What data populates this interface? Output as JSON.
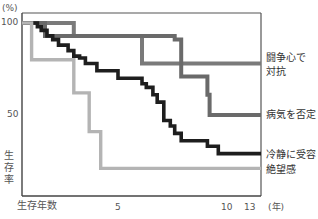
{
  "chart_data": {
    "type": "line",
    "subtype": "step (Kaplan-Meier survival curve)",
    "title": "",
    "xlabel": "生存年数",
    "x_unit": "(年)",
    "ylabel": "生存率",
    "y_unit": "(%)",
    "x_ticks": [
      {
        "label": "5",
        "value": 5
      },
      {
        "label": "10",
        "value": 10
      },
      {
        "label": "13",
        "value": 13
      }
    ],
    "y_ticks": [
      {
        "label": "100",
        "value": 100
      },
      {
        "label": "50",
        "value": 50
      }
    ],
    "xlim": [
      0,
      13
    ],
    "ylim": [
      15,
      100
    ],
    "grid": false,
    "legend_position": "right, labels placed at line ends",
    "series": [
      {
        "name": "闘争心で対抗",
        "label_lines": [
          "闘争心で",
          "対抗"
        ],
        "color": "#7a7a7a",
        "points": [
          [
            0,
            100
          ],
          [
            2.7,
            100
          ],
          [
            2.7,
            93
          ],
          [
            6.1,
            93
          ],
          [
            6.1,
            78
          ],
          [
            13,
            78
          ]
        ]
      },
      {
        "name": "病気を否定",
        "label_lines": [
          "病気を否定"
        ],
        "color": "#6a6a6a",
        "points": [
          [
            0,
            100
          ],
          [
            1.2,
            100
          ],
          [
            1.2,
            93
          ],
          [
            7.6,
            93
          ],
          [
            7.6,
            91
          ],
          [
            7.9,
            91
          ],
          [
            7.9,
            71
          ],
          [
            9.1,
            71
          ],
          [
            9.1,
            61
          ],
          [
            9.2,
            61
          ],
          [
            9.2,
            50
          ],
          [
            13,
            50
          ]
        ]
      },
      {
        "name": "冷静に受容",
        "label_lines": [
          "冷静に受容"
        ],
        "color": "#1e1e1e",
        "points": [
          [
            0,
            100
          ],
          [
            0.8,
            100
          ],
          [
            0.8,
            98
          ],
          [
            1.0,
            98
          ],
          [
            1.0,
            96
          ],
          [
            1.3,
            96
          ],
          [
            1.3,
            93
          ],
          [
            1.6,
            93
          ],
          [
            1.6,
            91
          ],
          [
            1.9,
            91
          ],
          [
            1.9,
            88
          ],
          [
            2.4,
            88
          ],
          [
            2.4,
            85
          ],
          [
            2.7,
            85
          ],
          [
            2.7,
            82
          ],
          [
            3.0,
            82
          ],
          [
            3.0,
            81
          ],
          [
            3.3,
            81
          ],
          [
            3.3,
            78
          ],
          [
            3.9,
            78
          ],
          [
            3.9,
            74
          ],
          [
            5.0,
            74
          ],
          [
            5.0,
            70
          ],
          [
            6.1,
            70
          ],
          [
            6.1,
            67
          ],
          [
            6.3,
            67
          ],
          [
            6.3,
            65
          ],
          [
            6.6,
            65
          ],
          [
            6.6,
            61
          ],
          [
            6.8,
            61
          ],
          [
            6.8,
            57
          ],
          [
            7.1,
            57
          ],
          [
            7.1,
            47
          ],
          [
            7.4,
            47
          ],
          [
            7.4,
            44
          ],
          [
            7.6,
            44
          ],
          [
            7.6,
            40
          ],
          [
            7.9,
            40
          ],
          [
            7.9,
            36
          ],
          [
            9.1,
            36
          ],
          [
            9.1,
            33
          ],
          [
            9.6,
            33
          ],
          [
            9.6,
            29
          ],
          [
            13,
            29
          ]
        ]
      },
      {
        "name": "絶望感",
        "label_lines": [
          "絶望感"
        ],
        "color": "#b4b4b4",
        "points": [
          [
            0,
            100
          ],
          [
            0.5,
            100
          ],
          [
            0.5,
            80
          ],
          [
            2.7,
            80
          ],
          [
            2.7,
            62
          ],
          [
            3.5,
            62
          ],
          [
            3.5,
            41
          ],
          [
            4.1,
            41
          ],
          [
            4.1,
            21
          ],
          [
            13,
            21
          ]
        ]
      }
    ]
  },
  "axis": {
    "y_unit": "(%)",
    "y100": "100",
    "y50": "50",
    "ylabel": "生存率",
    "xlabel": "生存年数",
    "x5": "5",
    "x10": "10",
    "x13": "13",
    "x_unit": "(年)"
  },
  "legend": {
    "s1_line1": "闘争心で",
    "s1_line2": "対抗",
    "s2": "病気を否定",
    "s3": "冷静に受容",
    "s4": "絶望感"
  }
}
